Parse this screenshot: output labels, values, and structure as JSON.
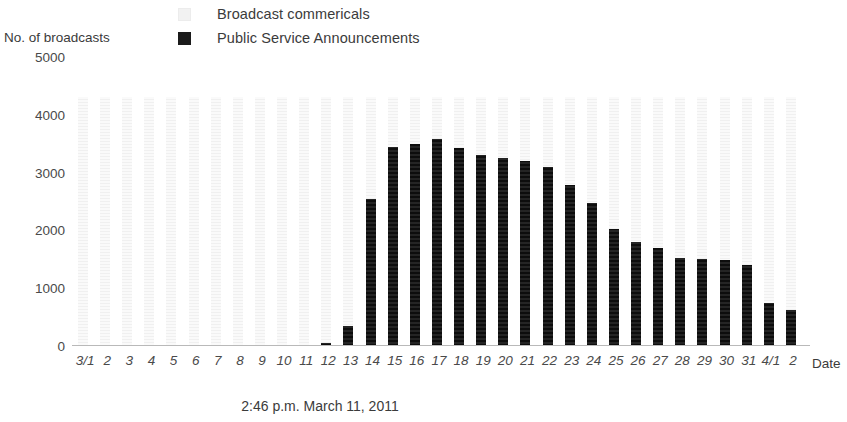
{
  "y_axis_title": "No. of broadcasts",
  "x_axis_title": "Date",
  "caption": "2:46 p.m. March 11, 2011",
  "legend": {
    "items": [
      {
        "label": "Broadcast commericals",
        "color": "#f2f2f2",
        "swatch": "light-square-swatch"
      },
      {
        "label": "Public Service Announcements",
        "color": "#1b1b1b",
        "swatch": "dark-square-swatch"
      }
    ]
  },
  "chart_data": {
    "type": "bar",
    "title": "",
    "xlabel": "Date",
    "ylabel": "No. of broadcasts",
    "ylim": [
      0,
      5000
    ],
    "yticks": [
      0,
      1000,
      2000,
      3000,
      4000,
      5000
    ],
    "grid": false,
    "legend_position": "top",
    "categories": [
      "3/1",
      "2",
      "3",
      "4",
      "5",
      "6",
      "7",
      "8",
      "9",
      "10",
      "11",
      "12",
      "13",
      "14",
      "15",
      "16",
      "17",
      "18",
      "19",
      "20",
      "21",
      "22",
      "23",
      "24",
      "25",
      "26",
      "27",
      "28",
      "29",
      "30",
      "31",
      "4/1",
      "2"
    ],
    "series": [
      {
        "name": "Broadcast commericals",
        "color": "#f2f2f2",
        "values": [
          4300,
          4300,
          4300,
          4300,
          4300,
          4300,
          4300,
          4300,
          4300,
          4300,
          4300,
          4300,
          4300,
          4300,
          4300,
          4300,
          4300,
          4300,
          4300,
          4300,
          4300,
          4300,
          4300,
          4300,
          4300,
          4300,
          4300,
          4300,
          4300,
          4300,
          4300,
          4300,
          4300
        ]
      },
      {
        "name": "Public Service Announcements",
        "color": "#1b1b1b",
        "values": [
          0,
          0,
          0,
          0,
          0,
          0,
          0,
          0,
          0,
          0,
          0,
          60,
          350,
          2550,
          3450,
          3500,
          3580,
          3430,
          3300,
          3250,
          3200,
          3100,
          2780,
          2470,
          2030,
          1800,
          1700,
          1530,
          1510,
          1480,
          1400,
          750,
          620
        ]
      }
    ]
  }
}
